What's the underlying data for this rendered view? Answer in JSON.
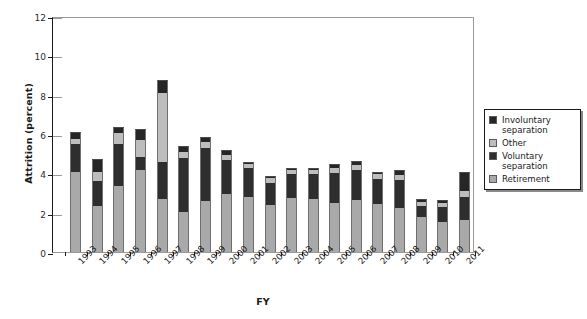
{
  "chart_data": {
    "type": "bar",
    "subtype": "stacked-vertical",
    "title": "",
    "xlabel": "FY",
    "ylabel": "Attrition (percent)",
    "ylim": [
      0,
      12
    ],
    "yticks": [
      0,
      2,
      4,
      6,
      8,
      10,
      12
    ],
    "ytick_labels": [
      "0",
      "2",
      "4",
      "6",
      "8",
      "10",
      "12"
    ],
    "grid": false,
    "legend_position": "right-outside",
    "categories": [
      "1993",
      "1994",
      "1995",
      "1996",
      "1997",
      "1998",
      "1999",
      "2000",
      "2001",
      "2002",
      "2003",
      "2004",
      "2005",
      "2006",
      "2007",
      "2008",
      "2009",
      "2010",
      "2011"
    ],
    "series": [
      {
        "name": "Retirement",
        "color": "#a9a9a9",
        "values": [
          4.05,
          2.35,
          3.35,
          4.15,
          2.7,
          2.05,
          2.6,
          2.95,
          2.8,
          2.4,
          2.75,
          2.7,
          2.5,
          2.65,
          2.45,
          2.25,
          1.8,
          1.55,
          1.65
        ]
      },
      {
        "name": "Voluntary separation",
        "color": "#2e2e2e",
        "values": [
          1.45,
          1.25,
          2.15,
          0.7,
          1.9,
          2.75,
          2.7,
          1.75,
          1.45,
          1.1,
          1.2,
          1.25,
          1.5,
          1.5,
          1.25,
          1.4,
          0.55,
          0.75,
          1.15
        ]
      },
      {
        "name": "Other",
        "color": "#bdbdbd",
        "values": [
          0.25,
          0.45,
          0.55,
          0.85,
          3.5,
          0.3,
          0.3,
          0.25,
          0.25,
          0.25,
          0.2,
          0.2,
          0.25,
          0.25,
          0.25,
          0.25,
          0.2,
          0.2,
          0.3
        ]
      },
      {
        "name": "Involuntary separation",
        "color": "#262626",
        "values": [
          0.35,
          0.7,
          0.3,
          0.55,
          0.65,
          0.3,
          0.25,
          0.25,
          0.1,
          0.1,
          0.1,
          0.1,
          0.25,
          0.25,
          0.1,
          0.25,
          0.15,
          0.15,
          0.95
        ]
      }
    ],
    "totals": [
      6.1,
      4.75,
      6.35,
      6.25,
      8.75,
      5.4,
      5.85,
      5.2,
      4.6,
      3.85,
      4.25,
      4.25,
      4.5,
      4.65,
      4.05,
      4.15,
      2.7,
      2.65,
      4.05
    ]
  },
  "legend": {
    "items": [
      {
        "label": "Involuntary separation",
        "color": "#262626"
      },
      {
        "label": "Other",
        "color": "#bdbdbd"
      },
      {
        "label": "Voluntary separation",
        "color": "#2e2e2e"
      },
      {
        "label": "Retirement",
        "color": "#a9a9a9"
      }
    ]
  },
  "axes": {
    "x_title": "FY",
    "y_title": "Attrition (percent)"
  }
}
